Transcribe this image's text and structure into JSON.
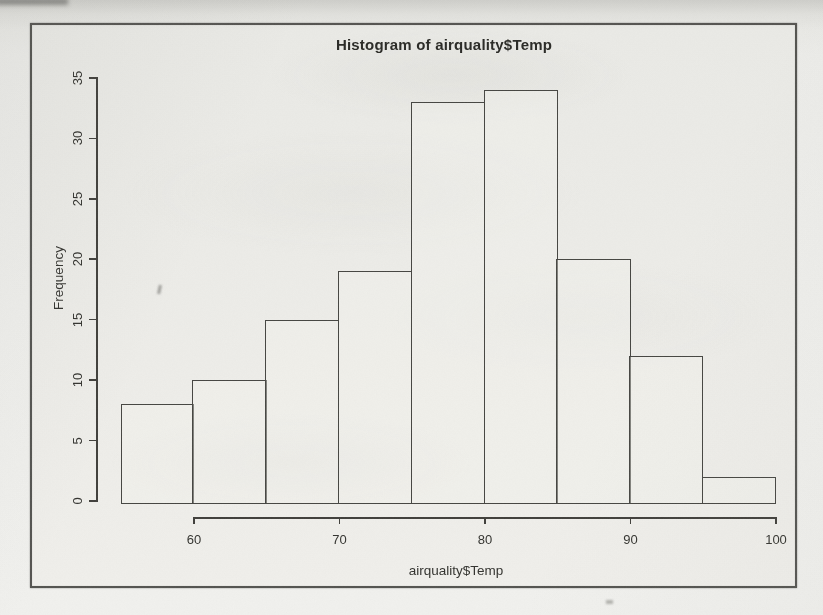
{
  "chart_data": {
    "type": "bar",
    "variant": "histogram",
    "title": "Histogram of airquality$Temp",
    "xlabel": "airquality$Temp",
    "ylabel": "Frequency",
    "bin_edges": [
      55,
      60,
      65,
      70,
      75,
      80,
      85,
      90,
      95,
      100
    ],
    "counts": [
      8,
      10,
      15,
      19,
      33,
      34,
      20,
      12,
      2
    ],
    "x_tick_values": [
      60,
      70,
      80,
      90,
      100
    ],
    "x_tick_labels": [
      "60",
      "70",
      "80",
      "90",
      "100"
    ],
    "y_tick_values": [
      0,
      5,
      10,
      15,
      20,
      25,
      30,
      35
    ],
    "y_tick_labels": [
      "0",
      "5",
      "10",
      "15",
      "20",
      "25",
      "30",
      "35"
    ],
    "xlim": [
      55,
      100
    ],
    "ylim": [
      0,
      35
    ],
    "grid": false,
    "bar_fill": "none",
    "bar_edge_color": "#454541"
  },
  "colors": {
    "page_background": "#efefec",
    "frame_border": "#3e3e3a",
    "axis_color": "#403f3b",
    "text_color": "#2a2a26"
  }
}
